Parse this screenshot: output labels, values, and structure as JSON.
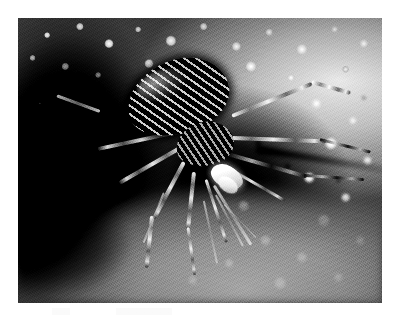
{
  "page": {
    "background_color": "#ffffff",
    "width": 399,
    "height": 322
  },
  "photograph": {
    "title": "Spider at burrow entrance",
    "subject": "spider",
    "color_mode": "black-and-white",
    "style": "macro photograph",
    "frame": {
      "left": 18,
      "top": 18,
      "width": 364,
      "height": 285,
      "border_color": "#ffffff"
    },
    "palette": {
      "highlight": "#ffffff",
      "sand_light": "#d8d8d8",
      "sand_mid": "#9e9e9e",
      "shadow_mid": "#4a4a4a",
      "shadow_deep": "#0a0a0a",
      "black": "#050505"
    },
    "regions": [
      {
        "name": "granular-sand-top",
        "description": "bright clumped sand grains along the upper edge"
      },
      {
        "name": "burrow-shadow-left",
        "description": "deep black shadowed burrow mass on the left"
      },
      {
        "name": "bright-sand-right",
        "description": "high-contrast sunlit granular sand on the right"
      },
      {
        "name": "blurred-foreground",
        "description": "out-of-focus mid-grey sand across the lower area"
      },
      {
        "name": "dark-streak",
        "description": "dark diagonal shadow streak crossing the right sand"
      }
    ],
    "subject_parts": [
      {
        "name": "abdomen",
        "description": "dark striped abdomen, upper left of the body"
      },
      {
        "name": "carapace",
        "description": "cephalothorax with pale striping"
      },
      {
        "name": "prey-highlight",
        "description": "bright white elongated shape beneath the head"
      },
      {
        "name": "legs-right",
        "description": "long legs extending right across the bright sand"
      },
      {
        "name": "legs-lower",
        "description": "thin legs trailing down over the blurred foreground"
      }
    ]
  },
  "caption": {
    "text": ""
  }
}
